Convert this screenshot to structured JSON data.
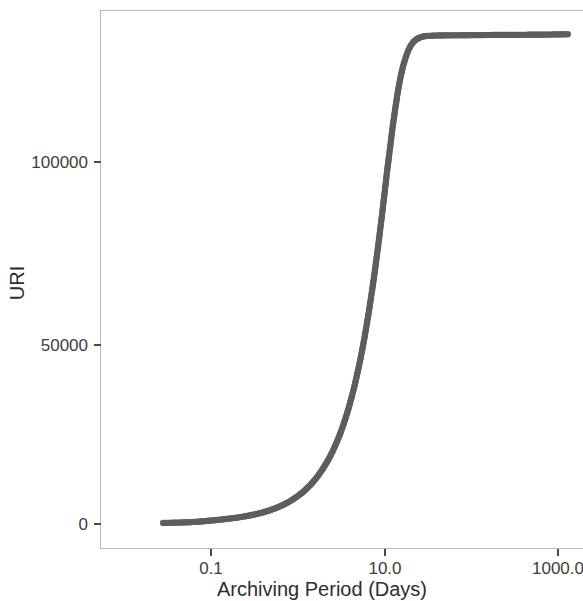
{
  "chart_data": {
    "type": "scatter",
    "title": "",
    "subtitle": "",
    "xlabel": "Archiving Period (Days)",
    "ylabel": "URI",
    "x_scale": "log",
    "y_scale": "linear",
    "grid": false,
    "legend": null,
    "marker": {
      "shape": "circle",
      "color": "#5e5e5e",
      "radius_px": 3.1
    },
    "background_color": "#ffffff",
    "frame_color": "#b9b9b9",
    "xticks": [
      "0.1",
      "10.0",
      "1000.0"
    ],
    "xtick_values": [
      0.1,
      10.0,
      1000.0
    ],
    "yticks": [
      "0",
      "50000",
      "100000"
    ],
    "ytick_values": [
      0,
      50000,
      100000
    ],
    "xlim": [
      0.022,
      1550
    ],
    "ylim": [
      -4000,
      141000
    ],
    "series": [
      {
        "name": "URI cumulative count",
        "color": "#5e5e5e",
        "points": [
          [
            0.028,
            300
          ],
          [
            0.042,
            400
          ],
          [
            0.05,
            450
          ],
          [
            0.056,
            500
          ],
          [
            0.061,
            550
          ],
          [
            0.066,
            600
          ],
          [
            0.071,
            650
          ],
          [
            0.076,
            700
          ],
          [
            0.081,
            760
          ],
          [
            0.086,
            820
          ],
          [
            0.092,
            880
          ],
          [
            0.098,
            940
          ],
          [
            0.105,
            1000
          ],
          [
            0.112,
            1070
          ],
          [
            0.12,
            1140
          ],
          [
            0.128,
            1210
          ],
          [
            0.137,
            1290
          ],
          [
            0.147,
            1370
          ],
          [
            0.157,
            1450
          ],
          [
            0.168,
            1540
          ],
          [
            0.18,
            1630
          ],
          [
            0.193,
            1730
          ],
          [
            0.206,
            1830
          ],
          [
            0.221,
            1940
          ],
          [
            0.236,
            2050
          ],
          [
            0.253,
            2170
          ],
          [
            0.271,
            2300
          ],
          [
            0.29,
            2440
          ],
          [
            0.31,
            2590
          ],
          [
            0.332,
            2750
          ],
          [
            0.356,
            2920
          ],
          [
            0.381,
            3100
          ],
          [
            0.408,
            3300
          ],
          [
            0.437,
            3510
          ],
          [
            0.468,
            3740
          ],
          [
            0.501,
            3980
          ],
          [
            0.536,
            4240
          ],
          [
            0.574,
            4520
          ],
          [
            0.615,
            4820
          ],
          [
            0.658,
            5140
          ],
          [
            0.705,
            5490
          ],
          [
            0.755,
            5860
          ],
          [
            0.808,
            6260
          ],
          [
            0.865,
            6690
          ],
          [
            0.927,
            7150
          ],
          [
            0.992,
            7650
          ],
          [
            1.06,
            8180
          ],
          [
            1.14,
            8760
          ],
          [
            1.22,
            9380
          ],
          [
            1.3,
            10050
          ],
          [
            1.4,
            10780
          ],
          [
            1.49,
            11560
          ],
          [
            1.6,
            12400
          ],
          [
            1.71,
            13310
          ],
          [
            1.83,
            14290
          ],
          [
            1.96,
            15350
          ],
          [
            2.1,
            16500
          ],
          [
            2.25,
            17740
          ],
          [
            2.41,
            19090
          ],
          [
            2.58,
            20550
          ],
          [
            2.76,
            22130
          ],
          [
            2.96,
            23840
          ],
          [
            3.17,
            25700
          ],
          [
            3.39,
            27710
          ],
          [
            3.63,
            29900
          ],
          [
            3.89,
            32270
          ],
          [
            4.16,
            34840
          ],
          [
            4.46,
            37630
          ],
          [
            4.77,
            40650
          ],
          [
            5.11,
            43920
          ],
          [
            5.47,
            47450
          ],
          [
            5.86,
            51250
          ],
          [
            6.27,
            55350
          ],
          [
            6.71,
            59740
          ],
          [
            7.19,
            64440
          ],
          [
            7.7,
            69450
          ],
          [
            8.24,
            74760
          ],
          [
            8.82,
            80350
          ],
          [
            9.45,
            86180
          ],
          [
            10.1,
            92150
          ],
          [
            10.8,
            98150
          ],
          [
            11.6,
            104000
          ],
          [
            12.4,
            109600
          ],
          [
            13.3,
            114700
          ],
          [
            14.2,
            119200
          ],
          [
            15.2,
            123100
          ],
          [
            16.3,
            126300
          ],
          [
            17.5,
            128800
          ],
          [
            18.7,
            130700
          ],
          [
            20.0,
            132100
          ],
          [
            21.4,
            133100
          ],
          [
            23.0,
            133800
          ],
          [
            24.6,
            134200
          ],
          [
            26.3,
            134500
          ],
          [
            28.2,
            134700
          ],
          [
            30.2,
            134800
          ],
          [
            40.0,
            134950
          ],
          [
            60.0,
            135000
          ],
          [
            100.0,
            135050
          ],
          [
            200.0,
            135100
          ],
          [
            400.0,
            135150
          ],
          [
            700.0,
            135200
          ],
          [
            1000.0,
            135250
          ],
          [
            1300.0,
            135300
          ]
        ]
      }
    ]
  },
  "axes": {
    "y_title": "URI",
    "x_title": "Archiving Period (Days)",
    "y_tick_labels": [
      "100000",
      "50000",
      "0"
    ],
    "x_tick_labels": [
      "0.1",
      "10.0",
      "1000.0"
    ]
  }
}
